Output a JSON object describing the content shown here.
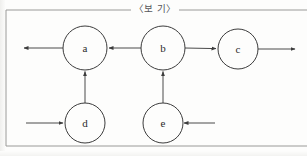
{
  "figure": {
    "caption": "〈보 기〉",
    "caption_role": "boxed-example-header",
    "border_color": "#9a9a98",
    "stroke_color": "#3c3c3c",
    "background_color": "#fdfdfc"
  },
  "diagram": {
    "type": "directed-graph",
    "nodes": [
      {
        "id": "a",
        "label": "a",
        "cx": 85,
        "cy": 48,
        "r": 22
      },
      {
        "id": "b",
        "label": "b",
        "cx": 163,
        "cy": 48,
        "r": 22
      },
      {
        "id": "c",
        "label": "c",
        "cx": 238,
        "cy": 49,
        "r": 20
      },
      {
        "id": "d",
        "label": "d",
        "cx": 85,
        "cy": 123,
        "r": 20
      },
      {
        "id": "e",
        "label": "e",
        "cx": 163,
        "cy": 123,
        "r": 20
      }
    ],
    "edges": [
      {
        "id": "edge-a-out-left",
        "from": "a",
        "to": "external",
        "direction": "left",
        "arrow_at": "end"
      },
      {
        "id": "edge-b-to-a",
        "from": "b",
        "to": "a",
        "direction": "left",
        "arrow_at": "end"
      },
      {
        "id": "edge-b-to-c",
        "from": "b",
        "to": "c",
        "direction": "right",
        "arrow_at": "end"
      },
      {
        "id": "edge-c-out-right",
        "from": "c",
        "to": "external",
        "direction": "right",
        "arrow_at": "end"
      },
      {
        "id": "edge-d-to-a",
        "from": "d",
        "to": "a",
        "direction": "up",
        "arrow_at": "end"
      },
      {
        "id": "edge-in-to-d",
        "from": "external",
        "to": "d",
        "direction": "right",
        "arrow_at": "end"
      },
      {
        "id": "edge-e-to-b",
        "from": "e",
        "to": "b",
        "direction": "up",
        "arrow_at": "end"
      },
      {
        "id": "edge-in-to-e",
        "from": "external",
        "to": "e",
        "direction": "left",
        "arrow_at": "end"
      }
    ]
  }
}
